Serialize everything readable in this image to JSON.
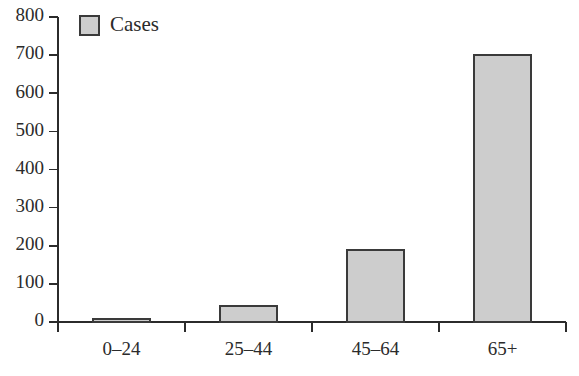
{
  "chart_data": {
    "type": "bar",
    "title": "",
    "subtitle": "",
    "xlabel": "",
    "ylabel": "",
    "categories": [
      "0–24",
      "25–44",
      "45–64",
      "65+"
    ],
    "values": [
      8,
      42,
      189,
      700
    ],
    "series": [
      {
        "name": "Cases",
        "values": [
          8,
          42,
          189,
          700
        ]
      }
    ],
    "ylim": [
      0,
      800
    ],
    "ytick_labels": [
      "0",
      "100",
      "200",
      "300",
      "400",
      "500",
      "600",
      "700",
      "800"
    ],
    "ytick_values": [
      0,
      100,
      200,
      300,
      400,
      500,
      600,
      700,
      800
    ],
    "grid": false,
    "legend": {
      "position": "top-left",
      "entries": [
        {
          "label": "Cases",
          "color": "#cdcdcd"
        }
      ]
    },
    "colors": {
      "bar_fill": "#cdcdcd",
      "bar_edge": "#3a3a3a",
      "axis": "#2b2b2b",
      "text": "#2b2b2b",
      "background": "#ffffff"
    }
  }
}
